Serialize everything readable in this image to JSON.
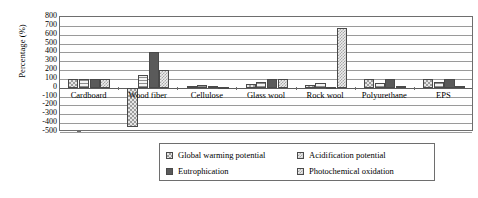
{
  "chart_data": {
    "type": "bar",
    "title": "",
    "xlabel": "",
    "ylabel": "Percentage (%)",
    "ylim": [
      -500,
      800
    ],
    "ytick_step": 100,
    "yticks": [
      800,
      700,
      600,
      500,
      400,
      300,
      200,
      100,
      0,
      -100,
      -200,
      -300,
      -400,
      -500
    ],
    "ytick_labels": [
      "800",
      "700",
      "600",
      "500",
      "400",
      "300",
      "200",
      "100",
      "0",
      "-100",
      "-200",
      "-300",
      "-400",
      "-500"
    ],
    "grid": true,
    "legend_position": "bottom-center",
    "categories": [
      "Cardboard",
      "Wood fiber",
      "Cellulose",
      "Glass wool",
      "Rock wool",
      "Polyurethane",
      "EPS"
    ],
    "series": [
      {
        "name": "Global warming potential",
        "pattern": "checkered-light",
        "values": [
          100,
          -440,
          15,
          40,
          30,
          100,
          100
        ]
      },
      {
        "name": "Acidification potential",
        "pattern": "horizontal-stripes",
        "values": [
          100,
          150,
          30,
          60,
          50,
          55,
          70
        ]
      },
      {
        "name": "Eutrophication",
        "pattern": "solid-dark",
        "values": [
          100,
          400,
          20,
          100,
          10,
          100,
          100
        ]
      },
      {
        "name": "Photochemical oxidation",
        "pattern": "dotted-checkered",
        "values": [
          100,
          200,
          10,
          95,
          680,
          25,
          25
        ]
      }
    ]
  },
  "axis": {
    "y_title": "Percentage (%)"
  },
  "legend": {
    "items": [
      {
        "label": "Global warming potential",
        "pattern": "checkered-light"
      },
      {
        "label": "Acidification potential",
        "pattern": "dotted-checkered"
      },
      {
        "label": "Eutrophication",
        "pattern": "solid-dark"
      },
      {
        "label": "Photochemical oxidation",
        "pattern": "dotted-checkered"
      }
    ]
  },
  "colors": {
    "frame": "#6e6e6e",
    "grid": "#9a9a9a",
    "bar_outline": "#4a4a4a",
    "series_gwp": "#e6e6e6",
    "series_acid": "#f0f0f0",
    "series_eutro": "#5a5a5a",
    "series_photo": "#ededed",
    "background": "#ffffff"
  }
}
